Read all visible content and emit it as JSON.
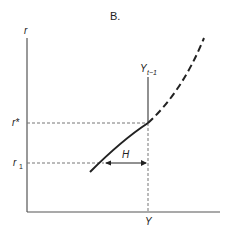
{
  "figure": {
    "title": "B.",
    "y_axis_label": "r",
    "x_axis_label": "Y",
    "levels": {
      "r_star": "r*",
      "r_1": "r",
      "r_1_subscript": "1"
    },
    "vertical_line_label": "Y",
    "vertical_line_subscript": "t−1",
    "gap_label": "H",
    "colors": {
      "line": "#222222",
      "axis": "#555555",
      "dashed": "#777777"
    }
  }
}
